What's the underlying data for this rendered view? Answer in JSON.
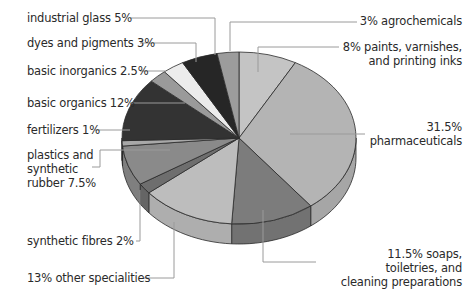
{
  "chart_data": {
    "type": "pie",
    "title": "",
    "style": "3d-exploded-none",
    "start_angle_deg": 0,
    "direction": "clockwise",
    "slices": [
      {
        "label": "paints, varnishes, and printing inks",
        "value": 8,
        "color": "#c4c4c4"
      },
      {
        "label": "pharmaceuticals",
        "value": 31.5,
        "color": "#b4b4b4"
      },
      {
        "label": "soaps, toiletries, and cleaning preparations",
        "value": 11.5,
        "color": "#7c7c7c"
      },
      {
        "label": "other specialities",
        "value": 13,
        "color": "#bdbdbd"
      },
      {
        "label": "synthetic fibres",
        "value": 2,
        "color": "#6e6e6e"
      },
      {
        "label": "plastics and synthetic rubber",
        "value": 7.5,
        "color": "#8a8a8a"
      },
      {
        "label": "fertilizers",
        "value": 1,
        "color": "#a8a8a8"
      },
      {
        "label": "basic organics",
        "value": 12,
        "color": "#333333"
      },
      {
        "label": "basic inorganics",
        "value": 2.5,
        "color": "#9a9a9a"
      },
      {
        "label": "dyes and pigments",
        "value": 3,
        "color": "#ececec"
      },
      {
        "label": "industrial glass",
        "value": 5,
        "color": "#262626"
      },
      {
        "label": "agrochemicals",
        "value": 3,
        "color": "#9c9c9c"
      }
    ]
  },
  "labels": {
    "industrial_glass": "industrial glass 5%",
    "dyes": "dyes and pigments 3%",
    "basic_inorganics": "basic inorganics 2.5%",
    "basic_organics": "basic organics 12%",
    "fertilizers": "fertilizers 1%",
    "plastics_1": "plastics and",
    "plastics_2": "synthetic",
    "plastics_3": "rubber 7.5%",
    "synthetic_fibres": "synthetic fibres 2%",
    "other_specialities": "13% other specialities",
    "agrochemicals": "3% agrochemicals",
    "paints_1": "8% paints, varnishes,",
    "paints_2": "and printing inks",
    "pharma_1": "31.5%",
    "pharma_2": "pharmaceuticals",
    "soaps_1": "11.5% soaps,",
    "soaps_2": "toiletries, and",
    "soaps_3": "cleaning preparations"
  }
}
